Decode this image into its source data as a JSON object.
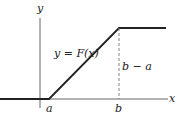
{
  "diagram": {
    "type": "piecewise-linear-function-graph",
    "axes": {
      "x_label": "x",
      "y_label": "y"
    },
    "curve_label": "y = F(x)",
    "tick_labels": {
      "a": "a",
      "b": "b"
    },
    "height_label": "b − a",
    "colors": {
      "line": "#222222",
      "axis": "#555555",
      "dashed": "#777777",
      "background": "#ffffff"
    }
  }
}
